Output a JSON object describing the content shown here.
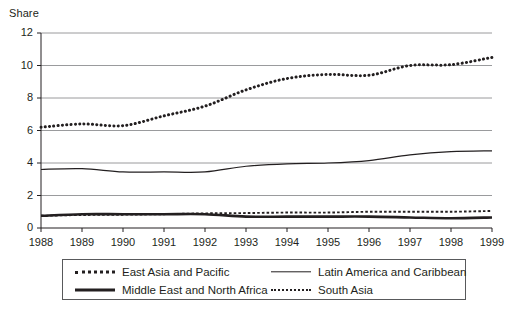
{
  "figure": {
    "title_fragment": "",
    "y_axis_label": "Share"
  },
  "legend": {
    "entries": [
      {
        "label": "East Asia and Pacific",
        "style": "thick-dotted",
        "row": 0,
        "col": 0
      },
      {
        "label": "Latin America and Caribbean",
        "style": "thin-solid",
        "row": 0,
        "col": 1
      },
      {
        "label": "Middle East and North Africa",
        "style": "thick-solid",
        "row": 1,
        "col": 0
      },
      {
        "label": "South Asia",
        "style": "thin-dotted",
        "row": 1,
        "col": 1
      }
    ]
  },
  "chart_data": {
    "type": "line",
    "title": "",
    "xlabel": "",
    "ylabel": "Share",
    "x": [
      1988,
      1989,
      1990,
      1991,
      1992,
      1993,
      1994,
      1995,
      1996,
      1997,
      1998,
      1999
    ],
    "xtick_labels": [
      "1988",
      "1989",
      "1990",
      "1991",
      "1992",
      "1993",
      "1994",
      "1995",
      "1996",
      "1997",
      "1998",
      "1999"
    ],
    "ytick_labels": [
      "0",
      "2",
      "4",
      "6",
      "8",
      "10",
      "12"
    ],
    "yticks": [
      0,
      2,
      4,
      6,
      8,
      10,
      12
    ],
    "ylim": [
      0,
      12
    ],
    "xlim": [
      1988,
      1999
    ],
    "grid": "horizontal",
    "legend_position": "below",
    "series": [
      {
        "name": "East Asia and Pacific",
        "style": "thick-dotted",
        "color": "#231f20",
        "values": [
          6.2,
          6.4,
          6.3,
          6.9,
          7.5,
          8.5,
          9.2,
          9.45,
          9.4,
          10.0,
          10.05,
          10.5
        ]
      },
      {
        "name": "Latin America and Caribbean",
        "style": "thin-solid",
        "color": "#231f20",
        "values": [
          3.6,
          3.65,
          3.45,
          3.45,
          3.45,
          3.8,
          3.95,
          4.0,
          4.15,
          4.5,
          4.7,
          4.75
        ]
      },
      {
        "name": "Middle East and North Africa",
        "style": "thick-solid",
        "color": "#231f20",
        "values": [
          0.75,
          0.85,
          0.85,
          0.85,
          0.85,
          0.7,
          0.7,
          0.7,
          0.7,
          0.65,
          0.6,
          0.65
        ]
      },
      {
        "name": "South Asia",
        "style": "thin-dotted",
        "color": "#231f20",
        "values": [
          0.75,
          0.8,
          0.82,
          0.85,
          0.9,
          0.92,
          0.95,
          0.95,
          1.0,
          1.0,
          1.0,
          1.05
        ]
      }
    ]
  }
}
